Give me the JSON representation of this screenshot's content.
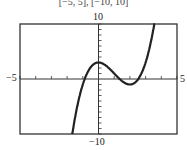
{
  "window_label": "[−5, 5], [−10, 10]",
  "labels": {
    "ymax": "10",
    "ymin": "−10",
    "xmin": "−5",
    "xmax": "5"
  },
  "chart_data": {
    "type": "line",
    "title": "",
    "xlabel": "",
    "ylabel": "",
    "xlim": [
      -5,
      5
    ],
    "ylim": [
      -10,
      10
    ],
    "x_ticks_step": 1,
    "y_ticks_step": 1,
    "grid": false,
    "series": [
      {
        "name": "f(x) = x^3 - 3x^2 + 3 (approx.)",
        "x": [
          -1.7,
          -1,
          -0.5,
          0,
          0.5,
          1,
          1.5,
          2,
          2.5,
          3,
          3.6
        ],
        "y": [
          -10.6,
          -1,
          2.1,
          3,
          2.4,
          1,
          -0.4,
          -1,
          -0.1,
          3,
          10.7
        ]
      }
    ],
    "annotations": [
      "10",
      "−10",
      "−5",
      "5"
    ]
  }
}
